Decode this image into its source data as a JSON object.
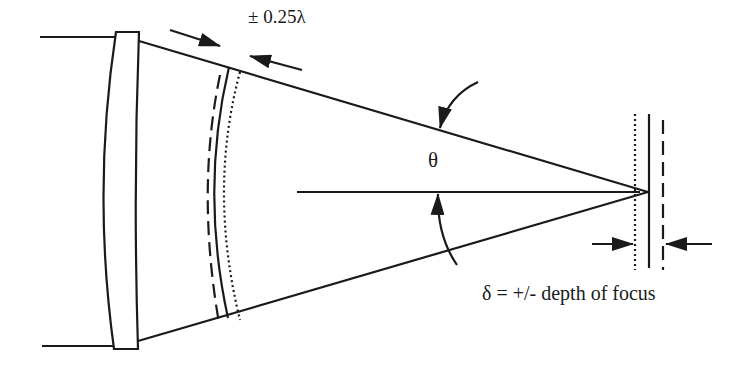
{
  "diagram": {
    "title": "",
    "labels": {
      "wavefront_tolerance": "± 0.25λ",
      "cone_angle": "θ",
      "depth_of_focus": "δ = +/- depth of focus"
    },
    "elements": {
      "lens": "lens",
      "input_beam": "collimated input beam",
      "converging_cone": "converging light cone",
      "optical_axis": "optical axis",
      "wavefronts": [
        "reference wavefront (solid)",
        "advanced wavefront (dashed)",
        "retarded wavefront (dotted)"
      ],
      "focal_planes": [
        "near focal plane (dotted)",
        "nominal focal plane (solid)",
        "far focal plane (dashed)"
      ]
    },
    "colors": {
      "stroke": "#1a1a1a",
      "background": "#ffffff"
    }
  }
}
